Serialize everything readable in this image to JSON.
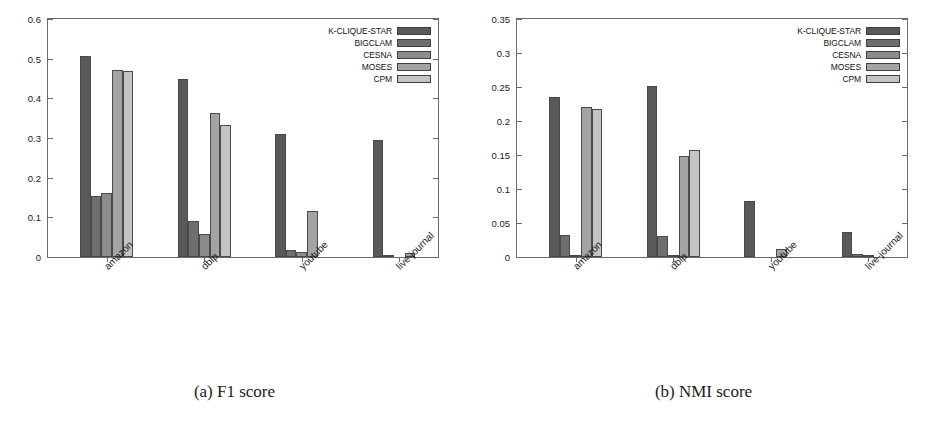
{
  "figure": {
    "series_names": [
      "K-CLIQUE-STAR",
      "BIGCLAM",
      "CESNA",
      "MOSES",
      "CPM"
    ],
    "series_colors": [
      "#595959",
      "#6e6e6e",
      "#8c8c8c",
      "#a3a3a3",
      "#c4c4c4"
    ],
    "datasets": [
      "amazon",
      "dblp",
      "youtube",
      "live-journal"
    ]
  },
  "panels": [
    {
      "key": "f1",
      "caption": "(a) F1 score",
      "legend_labels": [
        "K-CLIQUE-STAR",
        "BIGCLAM",
        "CESNA",
        "MOSES",
        "CPM"
      ],
      "ytick_labels": [
        "0",
        "0.1",
        "0.2",
        "0.3",
        "0.4",
        "0.5",
        "0.6"
      ],
      "xtick_labels": [
        "amazon",
        "dblp",
        "youtube",
        "live-journal"
      ]
    },
    {
      "key": "nmi",
      "caption": "(b) NMI score",
      "legend_labels": [
        "K-CLIQUE-STAR",
        "BIGCLAM",
        "CESNA",
        "MOSES",
        "CPM"
      ],
      "ytick_labels": [
        "0",
        "0.05",
        "0.1",
        "0.15",
        "0.2",
        "0.25",
        "0.3",
        "0.35"
      ],
      "xtick_labels": [
        "amazon",
        "dblp",
        "youtube",
        "live-journal"
      ]
    }
  ],
  "chart_data": [
    {
      "type": "bar",
      "title": "(a) F1 score",
      "xlabel": "",
      "ylabel": "",
      "ylim": [
        0,
        0.6
      ],
      "yticks": [
        0,
        0.1,
        0.2,
        0.3,
        0.4,
        0.5,
        0.6
      ],
      "grid": false,
      "legend_position": "top-right",
      "categories": [
        "amazon",
        "dblp",
        "youtube",
        "live-journal"
      ],
      "series": [
        {
          "name": "K-CLIQUE-STAR",
          "color": "#595959",
          "values": [
            0.506,
            0.448,
            0.31,
            0.294
          ]
        },
        {
          "name": "BIGCLAM",
          "color": "#6e6e6e",
          "values": [
            0.154,
            0.091,
            0.018,
            0.002
          ]
        },
        {
          "name": "CESNA",
          "color": "#8c8c8c",
          "values": [
            0.162,
            0.058,
            0.012,
            0.0
          ]
        },
        {
          "name": "MOSES",
          "color": "#a3a3a3",
          "values": [
            0.472,
            0.362,
            0.117,
            0.011
          ]
        },
        {
          "name": "CPM",
          "color": "#c4c4c4",
          "values": [
            0.469,
            0.334,
            0.0,
            0.0
          ]
        }
      ]
    },
    {
      "type": "bar",
      "title": "(b) NMI score",
      "xlabel": "",
      "ylabel": "",
      "ylim": [
        0,
        0.35
      ],
      "yticks": [
        0,
        0.05,
        0.1,
        0.15,
        0.2,
        0.25,
        0.3,
        0.35
      ],
      "grid": false,
      "legend_position": "top-right",
      "categories": [
        "amazon",
        "dblp",
        "youtube",
        "live-journal"
      ],
      "series": [
        {
          "name": "K-CLIQUE-STAR",
          "color": "#595959",
          "values": [
            0.235,
            0.251,
            0.083,
            0.037
          ]
        },
        {
          "name": "BIGCLAM",
          "color": "#6e6e6e",
          "values": [
            0.032,
            0.031,
            0.0,
            0.004
          ]
        },
        {
          "name": "CESNA",
          "color": "#8c8c8c",
          "values": [
            0.001,
            0.001,
            0.0005,
            0.003
          ]
        },
        {
          "name": "MOSES",
          "color": "#a3a3a3",
          "values": [
            0.221,
            0.149,
            0.012,
            0.0
          ]
        },
        {
          "name": "CPM",
          "color": "#c4c4c4",
          "values": [
            0.218,
            0.158,
            0.0,
            0.0
          ]
        }
      ]
    }
  ]
}
